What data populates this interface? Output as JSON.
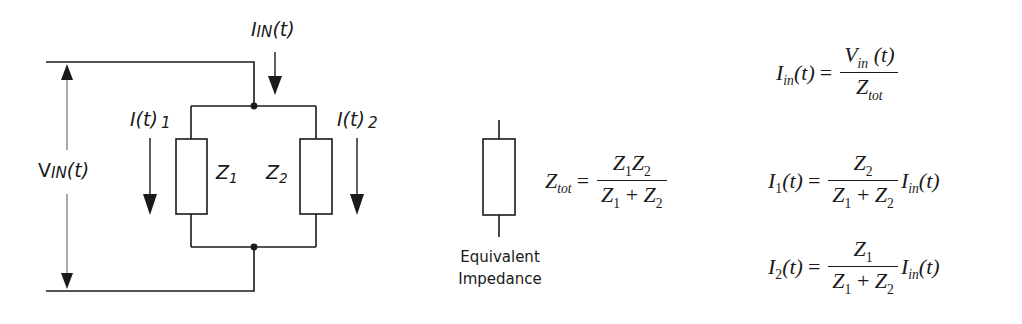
{
  "circuit": {
    "input_current_label": {
      "main": "I",
      "sub": "IN",
      "arg": "(t)"
    },
    "input_voltage_label": {
      "main": "V",
      "sub": "IN",
      "arg": "(t)"
    },
    "branch1_current_label": {
      "main": "I(t)",
      "sub": "1"
    },
    "branch2_current_label": {
      "main": "I(t)",
      "sub": "2"
    },
    "impedance1_label": {
      "main": "Z",
      "sub": "1"
    },
    "impedance2_label": {
      "main": "Z",
      "sub": "2"
    }
  },
  "equivalent": {
    "caption_line1": "Equivalent",
    "caption_line2": "Impedance",
    "formula": {
      "lhs": {
        "main": "Z",
        "sub": "tot"
      },
      "equals": "=",
      "numerator": {
        "a": "Z",
        "a_sub": "1",
        "b": "Z",
        "b_sub": "2"
      },
      "denominator": {
        "a": "Z",
        "a_sub": "1",
        "op": "+",
        "b": "Z",
        "b_sub": "2"
      }
    }
  },
  "equations": [
    {
      "lhs": {
        "main": "I",
        "sub": "in",
        "arg": "(t)"
      },
      "equals": "=",
      "numerator": {
        "main": "V",
        "sub": "in",
        "arg": "(t)"
      },
      "denominator": {
        "main": "Z",
        "sub": "tot"
      }
    },
    {
      "lhs": {
        "main": "I",
        "sub": "1",
        "arg": "(t)"
      },
      "equals": "=",
      "numerator": {
        "main": "Z",
        "sub": "2"
      },
      "denominator": {
        "a": "Z",
        "a_sub": "1",
        "op": "+",
        "b": "Z",
        "b_sub": "2"
      },
      "factor": {
        "main": "I",
        "sub": "in",
        "arg": "(t)"
      }
    },
    {
      "lhs": {
        "main": "I",
        "sub": "2",
        "arg": "(t)"
      },
      "equals": "=",
      "numerator": {
        "main": "Z",
        "sub": "1"
      },
      "denominator": {
        "a": "Z",
        "a_sub": "1",
        "op": "+",
        "b": "Z",
        "b_sub": "2"
      },
      "factor": {
        "main": "I",
        "sub": "in",
        "arg": "(t)"
      }
    }
  ],
  "colors": {
    "line": "#1a1a1a",
    "thin_line": "#555555",
    "background": "#ffffff"
  }
}
